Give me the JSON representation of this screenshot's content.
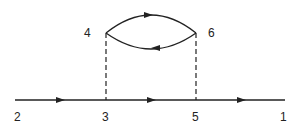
{
  "diagram": {
    "type": "feynman-diagram",
    "vertex_labels": {
      "v1": "1",
      "v2": "2",
      "v3": "3",
      "v4": "4",
      "v5": "5",
      "v6": "6"
    },
    "edges": [
      {
        "from": "2",
        "to": "3",
        "style": "solid",
        "arrow": "forward"
      },
      {
        "from": "3",
        "to": "5",
        "style": "solid",
        "arrow": "forward"
      },
      {
        "from": "5",
        "to": "1",
        "style": "solid",
        "arrow": "forward"
      },
      {
        "from": "3",
        "to": "4",
        "style": "dashed",
        "arrow": "none"
      },
      {
        "from": "5",
        "to": "6",
        "style": "dashed",
        "arrow": "none"
      },
      {
        "from": "4",
        "to": "6",
        "style": "solid-arc-upper",
        "arrow": "forward"
      },
      {
        "from": "6",
        "to": "4",
        "style": "solid-arc-lower",
        "arrow": "forward"
      }
    ],
    "colors": {
      "line": "#222222",
      "background": "#ffffff"
    }
  }
}
